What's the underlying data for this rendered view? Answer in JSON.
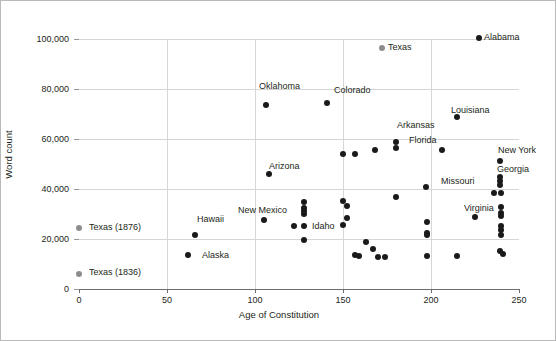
{
  "chart_data": {
    "type": "scatter",
    "title": "",
    "xlabel": "Age of Constitution",
    "ylabel": "Word count",
    "xlim": [
      0,
      250
    ],
    "ylim": [
      0,
      100000
    ],
    "xticks": [
      0,
      50,
      100,
      150,
      200,
      250
    ],
    "xtick_labels": [
      "0",
      "50",
      "100",
      "150",
      "200",
      "250"
    ],
    "yticks": [
      0,
      20000,
      40000,
      60000,
      80000,
      100000
    ],
    "ytick_labels": [
      "0",
      "20,000",
      "40,000",
      "60,000",
      "80,000",
      "100,000"
    ],
    "grid": "both",
    "legend": "none",
    "colors": {
      "point": "#1a1a1a",
      "highlight_point": "#8d8d8d",
      "grid": "#d6d6d6",
      "axis": "#6d6d6d",
      "text": "#231f20",
      "frame": "#b9b9b9"
    },
    "labeled_points": [
      {
        "label": "Alabama",
        "x": 227,
        "y": 100400,
        "color": "#1a1a1a",
        "lx": 483,
        "ly": 31
      },
      {
        "label": "Texas",
        "x": 172,
        "y": 96400,
        "color": "#8d8d8d",
        "lx": 387,
        "ly": 41
      },
      {
        "label": "Oklahoma",
        "x": 106,
        "y": 73800,
        "color": "#1a1a1a",
        "lx": 258,
        "ly": 80
      },
      {
        "label": "Colorado",
        "x": 141,
        "y": 74400,
        "color": "#1a1a1a",
        "lx": 333,
        "ly": 84
      },
      {
        "label": "Louisiana",
        "x": 215,
        "y": 69000,
        "color": "#1a1a1a",
        "lx": 450,
        "ly": 104
      },
      {
        "label": "Arkansas",
        "x": 180,
        "y": 58800,
        "color": "#1a1a1a",
        "lx": 396,
        "ly": 119
      },
      {
        "label": "Florida",
        "x": 180,
        "y": 56600,
        "color": "#1a1a1a",
        "lx": 408,
        "ly": 134
      },
      {
        "label": "New York",
        "x": 239,
        "y": 51400,
        "color": "#1a1a1a",
        "lx": 497,
        "ly": 144
      },
      {
        "label": "Georgia",
        "x": 239,
        "y": 45000,
        "color": "#1a1a1a",
        "lx": 496,
        "ly": 163
      },
      {
        "label": "Arizona",
        "x": 108,
        "y": 46000,
        "color": "#1a1a1a",
        "lx": 268,
        "ly": 160
      },
      {
        "label": "Missouri",
        "x": 197,
        "y": 41000,
        "color": "#1a1a1a",
        "lx": 440,
        "ly": 175
      },
      {
        "label": "New Mexico",
        "x": 105,
        "y": 27600,
        "color": "#1a1a1a",
        "lx": 237,
        "ly": 204
      },
      {
        "label": "Virginia",
        "x": 225,
        "y": 29000,
        "color": "#1a1a1a",
        "lx": 463,
        "ly": 202
      },
      {
        "label": "Idaho",
        "x": 128,
        "y": 30000,
        "color": "#1a1a1a",
        "lx": 311,
        "ly": 220
      },
      {
        "label": "Hawaii",
        "x": 66,
        "y": 21800,
        "color": "#1a1a1a",
        "lx": 196,
        "ly": 213
      },
      {
        "label": "Alaska",
        "x": 62,
        "y": 13600,
        "color": "#1a1a1a",
        "lx": 201,
        "ly": 249
      },
      {
        "label": "Texas (1876)",
        "x": 0,
        "y": 24400,
        "color": "#8d8d8d",
        "lx": 88,
        "ly": 221
      },
      {
        "label": "Texas (1836)",
        "x": 0,
        "y": 6200,
        "color": "#8d8d8d",
        "lx": 88,
        "ly": 266
      }
    ],
    "unlabeled_points": [
      {
        "x": 150,
        "y": 54000
      },
      {
        "x": 157,
        "y": 54000
      },
      {
        "x": 168,
        "y": 55600
      },
      {
        "x": 206,
        "y": 55800
      },
      {
        "x": 180,
        "y": 36800
      },
      {
        "x": 128,
        "y": 34800
      },
      {
        "x": 150,
        "y": 35200
      },
      {
        "x": 152,
        "y": 33200
      },
      {
        "x": 128,
        "y": 32600
      },
      {
        "x": 128,
        "y": 31400
      },
      {
        "x": 152,
        "y": 28600
      },
      {
        "x": 150,
        "y": 25600
      },
      {
        "x": 122,
        "y": 25400
      },
      {
        "x": 128,
        "y": 25400
      },
      {
        "x": 198,
        "y": 26800
      },
      {
        "x": 198,
        "y": 22600
      },
      {
        "x": 198,
        "y": 21600
      },
      {
        "x": 128,
        "y": 19800
      },
      {
        "x": 163,
        "y": 19000
      },
      {
        "x": 167,
        "y": 16200
      },
      {
        "x": 157,
        "y": 13600
      },
      {
        "x": 159,
        "y": 13200
      },
      {
        "x": 170,
        "y": 13000
      },
      {
        "x": 174,
        "y": 12800
      },
      {
        "x": 198,
        "y": 13400
      },
      {
        "x": 215,
        "y": 13400
      },
      {
        "x": 239,
        "y": 43200
      },
      {
        "x": 239,
        "y": 41600
      },
      {
        "x": 236,
        "y": 38600
      },
      {
        "x": 240,
        "y": 38400
      },
      {
        "x": 240,
        "y": 33000
      },
      {
        "x": 240,
        "y": 30400
      },
      {
        "x": 240,
        "y": 29400
      },
      {
        "x": 240,
        "y": 25200
      },
      {
        "x": 240,
        "y": 23600
      },
      {
        "x": 240,
        "y": 21800
      },
      {
        "x": 239,
        "y": 15200
      },
      {
        "x": 241,
        "y": 14200
      }
    ]
  }
}
